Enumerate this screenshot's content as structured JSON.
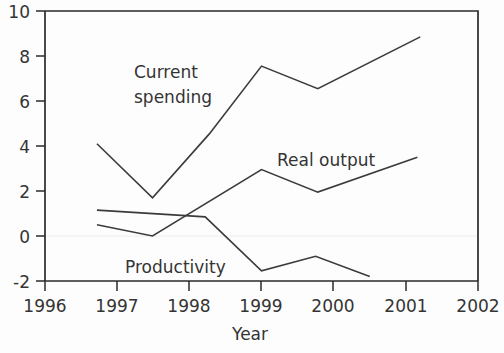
{
  "chart_data": {
    "type": "line",
    "title": "",
    "xlabel": "Year",
    "ylabel": "",
    "xlim": [
      1996,
      2002
    ],
    "ylim": [
      -2,
      10
    ],
    "xticks": [
      1996,
      1997,
      1998,
      1999,
      2000,
      2001,
      2002
    ],
    "xtick_labels": [
      "1996",
      "1997",
      "1998",
      "1999",
      "2000",
      "2001",
      "2002"
    ],
    "yticks": [
      -2,
      0,
      2,
      4,
      6,
      8,
      10
    ],
    "ytick_labels": [
      "-2",
      "0",
      "2",
      "4",
      "6",
      "8",
      "10"
    ],
    "grid": false,
    "legend_position": "inline-annotations",
    "line_color": "#3b3b3b",
    "axis_color": "#2a2a2a",
    "background_color": "#fdfdfd",
    "series": [
      {
        "name": "Current spending",
        "annotation": "Current spending",
        "annotation_lines": [
          "Current",
          "spending"
        ],
        "x": [
          1996.72,
          1997.49,
          1998.28,
          1999.0,
          1999.78,
          2001.2
        ],
        "values": [
          4.1,
          1.7,
          4.55,
          7.55,
          6.55,
          8.85
        ]
      },
      {
        "name": "Real output",
        "annotation": "Real output",
        "annotation_lines": [
          "Real output"
        ],
        "x": [
          1996.72,
          1997.49,
          1999.0,
          1999.78,
          2001.16
        ],
        "values": [
          0.5,
          0.0,
          2.95,
          1.95,
          3.5
        ]
      },
      {
        "name": "Productivity",
        "annotation": "Productivity",
        "annotation_lines": [
          "Productivity"
        ],
        "x": [
          1996.72,
          1998.22,
          1999.0,
          1999.75,
          2000.5
        ],
        "values": [
          1.15,
          0.85,
          -1.55,
          -0.9,
          -1.8
        ]
      }
    ],
    "annotations": [
      {
        "text": "Current spending",
        "x_px": 134,
        "y_px": 78
      },
      {
        "text": "Real output",
        "x_px": 277,
        "y_px": 160
      },
      {
        "text": "Productivity",
        "x_px": 125,
        "y_px": 267
      }
    ]
  }
}
